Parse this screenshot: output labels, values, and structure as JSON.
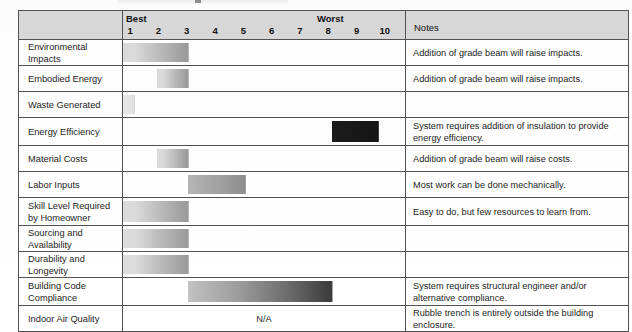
{
  "header": {
    "blank_label": "",
    "scale_best_label": "Best",
    "scale_worst_label": "Worst",
    "notes_label": "Notes",
    "ticks": [
      "1",
      "2",
      "3",
      "4",
      "5",
      "6",
      "7",
      "8",
      "9",
      "10"
    ]
  },
  "scale": {
    "min": 1,
    "max": 10,
    "best_end": "left",
    "worst_end": "right"
  },
  "colors": {
    "header_fill": "#d9d9d9",
    "grid_line": "#535353",
    "table_border": "#3b3b3b",
    "bar_light": "#dcdcdc",
    "bar_mid": "#9a9a9a",
    "bar_dark": "#3a3a3a",
    "bar_darkest": "#1c1c1c",
    "text": "#1d1d1d"
  },
  "chart_data": {
    "type": "bar",
    "title": "",
    "xlabel": "",
    "ylabel": "",
    "xlim": [
      1,
      10
    ],
    "grid": false,
    "legend": "none",
    "categories": [
      "Environmental Impacts",
      "Embodied Energy",
      "Waste Generated",
      "Energy Efficiency",
      "Material Costs",
      "Labor Inputs",
      "Skill Level Required by Homeowner",
      "Sourcing and Availability",
      "Durability and Longevity",
      "Building Code Compliance",
      "Indoor Air Quality"
    ],
    "series": [
      {
        "name": "Rating range (1 = Best, 10 = Worst)",
        "ranges": [
          [
            1.0,
            3.3
          ],
          [
            2.2,
            3.3
          ],
          [
            1.0,
            1.4
          ],
          [
            8.4,
            10.0
          ],
          [
            2.2,
            3.3
          ],
          [
            3.3,
            5.3
          ],
          [
            1.0,
            3.3
          ],
          [
            1.0,
            3.3
          ],
          [
            1.0,
            3.3
          ],
          [
            3.3,
            8.4
          ],
          null
        ]
      }
    ]
  },
  "rows": [
    {
      "label": "Environmental Impacts",
      "bar": {
        "start": 1.0,
        "end": 3.3,
        "gradient": "light-to-mid",
        "na": false
      },
      "note": "Addition of grade beam will raise impacts.",
      "tall": false
    },
    {
      "label": "Embodied Energy",
      "bar": {
        "start": 2.2,
        "end": 3.3,
        "gradient": "light-to-mid",
        "na": false
      },
      "note": " Addition of grade beam will raise impacts.",
      "tall": false
    },
    {
      "label": "Waste Generated",
      "bar": {
        "start": 1.0,
        "end": 1.4,
        "gradient": "faint",
        "na": false
      },
      "note": "",
      "tall": false
    },
    {
      "label": "Energy Efficiency",
      "bar": {
        "start": 8.4,
        "end": 10.0,
        "gradient": "darkest",
        "na": false
      },
      "note": "System requires addition of insulation to provide energy efficiency.",
      "tall": true
    },
    {
      "label": "Material Costs",
      "bar": {
        "start": 2.2,
        "end": 3.3,
        "gradient": "light-to-mid",
        "na": false
      },
      "note": "Addition of grade beam will raise costs.",
      "tall": false
    },
    {
      "label": "Labor Inputs",
      "bar": {
        "start": 3.3,
        "end": 5.3,
        "gradient": "mid",
        "na": false
      },
      "note": "Most work can be done mechanically.",
      "tall": false
    },
    {
      "label": "Skill Level Required by Homeowner",
      "bar": {
        "start": 1.0,
        "end": 3.3,
        "gradient": "light-to-mid",
        "na": false
      },
      "note": "Easy to do, but few resources to learn from.",
      "tall": true
    },
    {
      "label": "Sourcing and Availability",
      "bar": {
        "start": 1.0,
        "end": 3.3,
        "gradient": "light-to-mid",
        "na": false
      },
      "note": "",
      "tall": false
    },
    {
      "label": "Durability and Longevity",
      "bar": {
        "start": 1.0,
        "end": 3.3,
        "gradient": "light-to-mid",
        "na": false
      },
      "note": "",
      "tall": false
    },
    {
      "label": "Building Code Compliance",
      "bar": {
        "start": 3.3,
        "end": 8.4,
        "gradient": "mid-to-dark",
        "na": false
      },
      "note": "System requires structural engineer and/or alternative compliance.",
      "tall": true
    },
    {
      "label": "Indoor Air Quality",
      "bar": {
        "start": null,
        "end": null,
        "gradient": "none",
        "na": true
      },
      "na_label": "N/A",
      "note": "Rubble trench is entirely outside the building enclosure.",
      "tall": false
    }
  ]
}
